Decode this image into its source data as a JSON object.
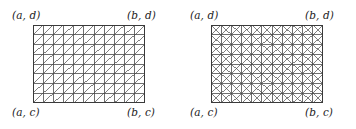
{
  "figure": {
    "caption": "",
    "type": "two-panel triangulated rectangular mesh diagram",
    "background_color": "#ffffff",
    "line_color": "#4a4a4a",
    "border_color": "#3a3a3a",
    "label_color": "#1b1b1b"
  },
  "panels": [
    {
      "id": "left",
      "name": "right-diagonal-triangulation",
      "mesh": {
        "columns": 11,
        "rows": 8,
        "diagonal_style": "single",
        "diagonal_direction": "bottom-left-to-top-right"
      },
      "labels": {
        "top_left": "(a, d)",
        "top_right": "(b, d)",
        "bottom_left": "(a, c)",
        "bottom_right": "(b, c)"
      }
    },
    {
      "id": "right",
      "name": "crossed-diagonal-triangulation",
      "mesh": {
        "columns": 11,
        "rows": 8,
        "diagonal_style": "crossed",
        "diagonal_direction": "both"
      },
      "labels": {
        "top_left": "(a, d)",
        "top_right": "(b, d)",
        "bottom_left": "(a, c)",
        "bottom_right": "(b, c)"
      }
    }
  ],
  "chart_data": {
    "type": "diagram",
    "title": "",
    "xlabel": "",
    "ylabel": "",
    "domain": {
      "x_range": [
        "a",
        "b"
      ],
      "y_range": [
        "c",
        "d"
      ]
    },
    "meshes": [
      {
        "panel": "left",
        "nx": 11,
        "ny": 8,
        "cells": 88,
        "triangles": 176,
        "diagonals": "single, ascending"
      },
      {
        "panel": "right",
        "nx": 11,
        "ny": 8,
        "cells": 88,
        "triangles": 352,
        "diagonals": "crossed, both directions"
      }
    ]
  }
}
